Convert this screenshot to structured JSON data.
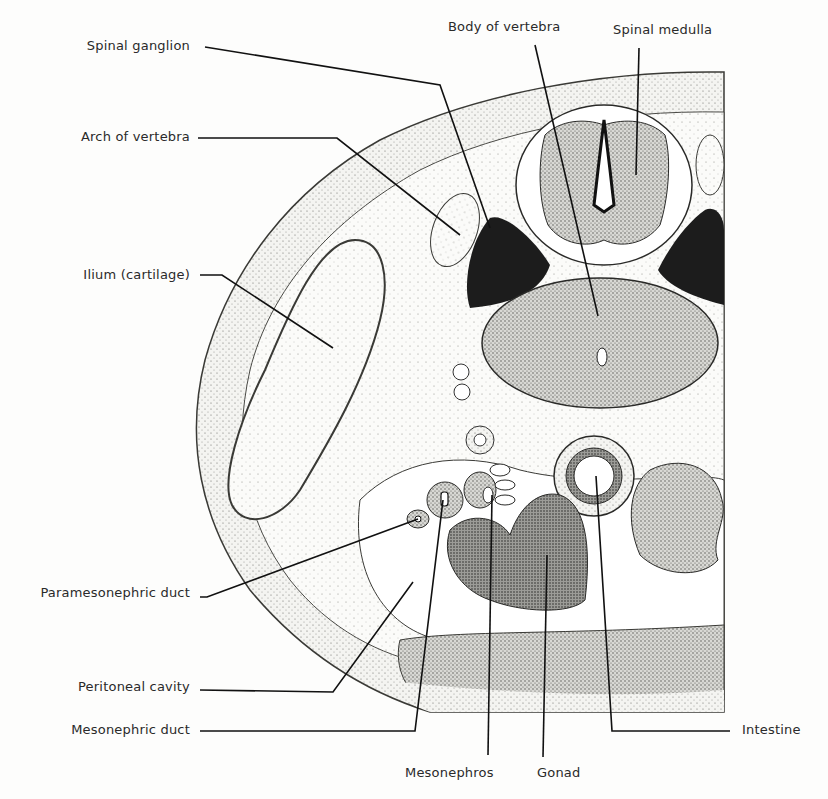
{
  "figure": {
    "type": "anatomical cross-section",
    "colors": {
      "ink": "#1a1a1a",
      "tissue_light": "#e9e9e6",
      "tissue_mid": "#bdbdb8",
      "tissue_dark": "#5a5a56",
      "ganglion": "#1c1c1c",
      "background": "#fdfdfc"
    }
  },
  "labels": {
    "spinal_ganglion": "Spinal ganglion",
    "arch_of_vertebra": "Arch of vertebra",
    "ilium": "Ilium (cartilage)",
    "paramesonephric_duct": "Paramesonephric duct",
    "peritoneal_cavity": "Peritoneal cavity",
    "mesonephric_duct": "Mesonephric duct",
    "body_of_vertebra": "Body of vertebra",
    "spinal_medulla": "Spinal medulla",
    "intestine": "Intestine",
    "mesonephros": "Mesonephros",
    "gonad": "Gonad"
  }
}
